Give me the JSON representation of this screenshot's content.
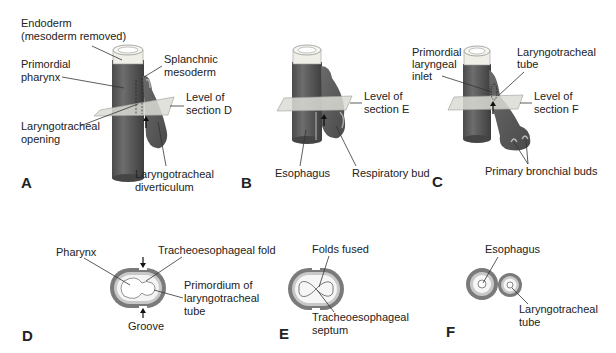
{
  "figure": {
    "panels": {
      "A": {
        "letter": "A",
        "labels": {
          "endoderm_1": "Endoderm",
          "endoderm_2": "(mesoderm removed)",
          "pharynx_1": "Primordial",
          "pharynx_2": "pharynx",
          "splanchnic_1": "Splanchnic",
          "splanchnic_2": "mesoderm",
          "level_1": "Level of",
          "level_2": "section D",
          "opening_1": "Laryngotracheal",
          "opening_2": "opening",
          "diverticulum_1": "Laryngotracheal",
          "diverticulum_2": "diverticulum"
        }
      },
      "B": {
        "letter": "B",
        "labels": {
          "level_1": "Level of",
          "level_2": "section E",
          "esophagus": "Esophagus",
          "respiratory_bud": "Respiratory bud"
        }
      },
      "C": {
        "letter": "C",
        "labels": {
          "inlet_1": "Primordial",
          "inlet_2": "laryngeal",
          "inlet_3": "inlet",
          "tube_1": "Laryngotracheal",
          "tube_2": "tube",
          "level_1": "Level of",
          "level_2": "section F",
          "bronchial_buds": "Primary bronchial buds"
        }
      },
      "D": {
        "letter": "D",
        "labels": {
          "pharynx": "Pharynx",
          "fold": "Tracheoesophageal fold",
          "primordium_1": "Primordium of",
          "primordium_2": "laryngotracheal",
          "primordium_3": "tube",
          "groove": "Groove"
        }
      },
      "E": {
        "letter": "E",
        "labels": {
          "folds_fused": "Folds fused",
          "septum_1": "Tracheoesophageal",
          "septum_2": "septum"
        }
      },
      "F": {
        "letter": "F",
        "labels": {
          "esophagus": "Esophagus",
          "tube_1": "Laryngotracheal",
          "tube_2": "tube"
        }
      }
    },
    "colors": {
      "tissue_dark": "#5e5e5e",
      "tissue_highlight": "#8a8a8a",
      "endoderm_light": "#f0f0ea",
      "plane": "#d8d8d4",
      "ring_outer": "#7a7a7a",
      "ring_inner": "#c8c8c8"
    }
  }
}
